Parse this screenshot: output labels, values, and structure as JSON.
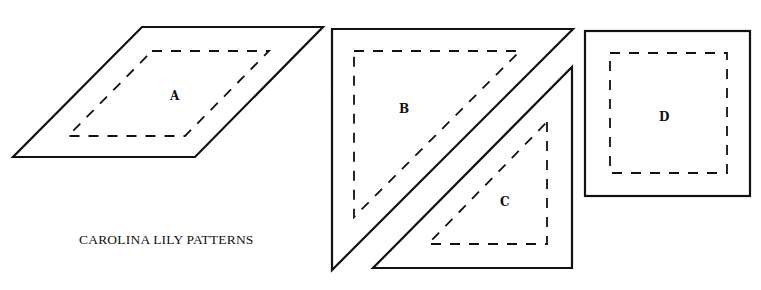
{
  "caption": "CAROLINA LILY PATTERNS",
  "colors": {
    "stroke": "#111111",
    "background": "#ffffff"
  },
  "pieces": [
    {
      "id": "A",
      "shape": "parallelogram",
      "label": "A"
    },
    {
      "id": "B",
      "shape": "right-triangle",
      "label": "B"
    },
    {
      "id": "C",
      "shape": "right-triangle",
      "label": "C"
    },
    {
      "id": "D",
      "shape": "square",
      "label": "D"
    }
  ]
}
